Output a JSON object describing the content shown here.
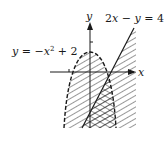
{
  "figure": {
    "type": "graph of system of inequalities",
    "axes": {
      "x_label": "x",
      "y_label": "y"
    },
    "curves": [
      {
        "name": "parabola",
        "label_lhs": "y",
        "label_eq": "=",
        "label_rhs_neg": "−",
        "label_rhs_var": "x",
        "label_rhs_exp": "2",
        "label_rhs_plus": "+",
        "label_rhs_const": "2",
        "equation": "y = −x² + 2",
        "boundary": "dashed",
        "shaded": "inside (below) parabola"
      },
      {
        "name": "line",
        "label_a": "2",
        "label_x": "x",
        "label_minus": "−",
        "label_y": "y",
        "label_eq": "=",
        "label_c": "4",
        "equation": "2x − y = 4",
        "boundary": "solid",
        "shaded": "right of / below line"
      }
    ],
    "overlap": "cross-hatched solution region"
  },
  "colors": {
    "ink": "#1a1a1a",
    "background": "#ffffff"
  }
}
